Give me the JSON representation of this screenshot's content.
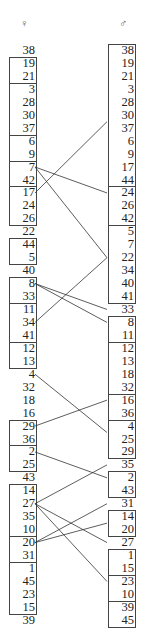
{
  "diagram": {
    "left_header": "♀",
    "right_header": "♂",
    "left_rows": [
      "38",
      "19",
      "21",
      "3",
      "28",
      "30",
      "37",
      "6",
      "9",
      "7",
      "42",
      "17",
      "24",
      "26",
      "22",
      "44",
      "5",
      "40",
      "8",
      "33",
      "11",
      "34",
      "41",
      "12",
      "13",
      "4",
      "32",
      "18",
      "16",
      "29",
      "36",
      "2",
      "25",
      "43",
      "14",
      "27",
      "35",
      "10",
      "20",
      "31",
      "1",
      "45",
      "23",
      "15",
      "39"
    ],
    "right_rows": [
      "38",
      "19",
      "21",
      "3",
      "28",
      "30",
      "37",
      "6",
      "9",
      "17",
      "44",
      "24",
      "26",
      "42",
      "5",
      "7",
      "22",
      "34",
      "40",
      "41",
      "33",
      "8",
      "11",
      "12",
      "13",
      "18",
      "32",
      "16",
      "36",
      "4",
      "25",
      "29",
      "35",
      "2",
      "43",
      "31",
      "14",
      "20",
      "27",
      "1",
      "15",
      "23",
      "10",
      "39",
      "45"
    ],
    "left_boxes": [
      [
        1,
        2
      ],
      [
        3,
        6
      ],
      [
        7,
        8
      ],
      [
        9,
        10
      ],
      [
        11,
        13
      ],
      [
        15,
        16
      ],
      [
        18,
        19
      ],
      [
        20,
        22
      ],
      [
        23,
        24
      ],
      [
        29,
        30
      ],
      [
        31,
        32
      ],
      [
        34,
        37
      ],
      [
        38,
        39
      ],
      [
        40,
        43
      ]
    ],
    "right_boxes": [
      [
        0,
        10
      ],
      [
        11,
        13
      ],
      [
        14,
        19
      ],
      [
        21,
        22
      ],
      [
        23,
        26
      ],
      [
        27,
        28
      ],
      [
        29,
        31
      ],
      [
        33,
        34
      ],
      [
        36,
        37
      ],
      [
        39,
        40
      ],
      [
        41,
        42
      ],
      [
        43,
        44
      ]
    ],
    "links": [
      {
        "from": 11,
        "to": 5.5
      },
      {
        "from": 9,
        "to": 11
      },
      {
        "from": 9,
        "to": 16
      },
      {
        "from": 21,
        "to": 16
      },
      {
        "from": 18,
        "to": 20
      },
      {
        "from": 18,
        "to": 21
      },
      {
        "from": 25,
        "to": 29.5
      },
      {
        "from": 29,
        "to": 27
      },
      {
        "from": 31,
        "to": 33
      },
      {
        "from": 35,
        "to": 32
      },
      {
        "from": 35,
        "to": 38
      },
      {
        "from": 35,
        "to": 41
      },
      {
        "from": 38,
        "to": 35
      },
      {
        "from": 38,
        "to": 36.5
      }
    ]
  }
}
